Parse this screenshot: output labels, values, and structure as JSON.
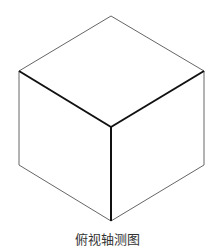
{
  "diagram": {
    "title": "俯视轴测图",
    "type": "isometric cube",
    "vertices": {
      "top": [
        111,
        16
      ],
      "left": [
        19,
        71
      ],
      "right": [
        204,
        71
      ],
      "center": [
        111,
        127
      ],
      "bottom_left": [
        19,
        165
      ],
      "bottom_right": [
        204,
        165
      ],
      "bottom": [
        111,
        221
      ]
    },
    "colors": {
      "thin_line": "#666666",
      "bold_line": "#111111",
      "caption": "#333333"
    }
  }
}
